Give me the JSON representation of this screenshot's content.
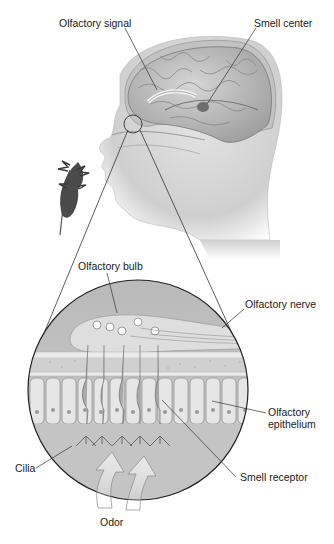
{
  "figure": {
    "labels": {
      "olfactory_signal": "Olfactory signal",
      "smell_center": "Smell center",
      "olfactory_bulb": "Olfactory bulb",
      "olfactory_nerve": "Olfactory nerve",
      "olfactory_epithelium_line1": "Olfactory",
      "olfactory_epithelium_line2": "epithelium",
      "cilia": "Cilia",
      "smell_receptor": "Smell receptor",
      "odor": "Odor"
    },
    "colors": {
      "background": "#ffffff",
      "skin": "#d4d4d4",
      "brain": "#bdbdbd",
      "brain_dark": "#8c8c8c",
      "inset_fill": "#c8c8c8",
      "cells": "#e6e6e6",
      "line": "#333333",
      "text": "#1a1a1a",
      "plant": "#4a4a4a"
    }
  }
}
